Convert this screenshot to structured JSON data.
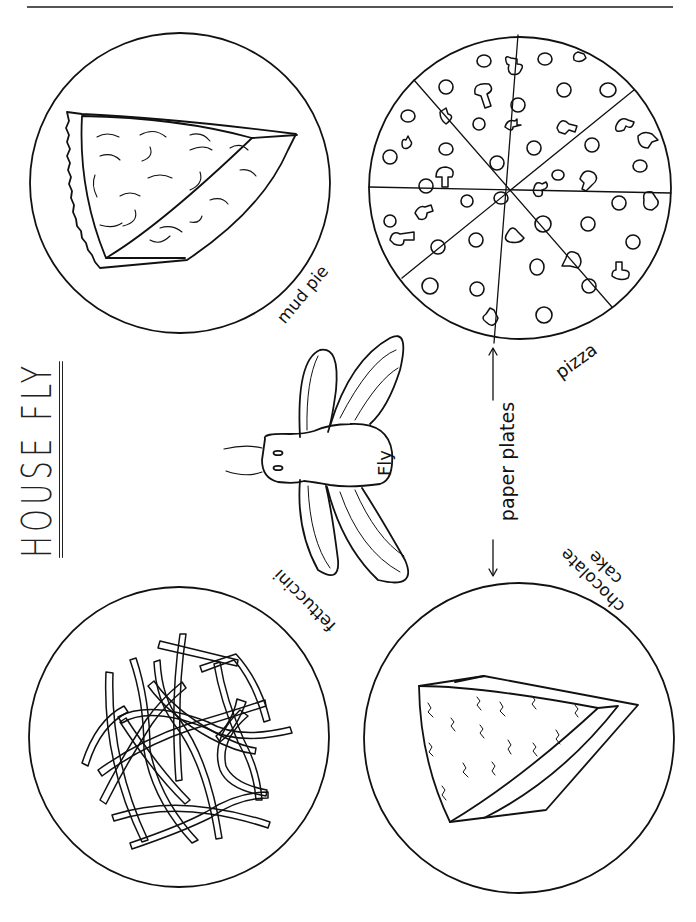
{
  "page": {
    "title": "HOUSE FLY",
    "background": "#ffffff",
    "ink_color": "#111111"
  },
  "plates": [
    {
      "id": "mud-pie",
      "label": "mud pie",
      "food": "pie slice with swirls",
      "cx": 180,
      "cy": 183,
      "r": 150
    },
    {
      "id": "pizza",
      "label": "pizza",
      "food": "pizza cut into 8 slices with pepperoni and mushrooms",
      "cx": 520,
      "cy": 188,
      "r": 151
    },
    {
      "id": "fettuccini",
      "label": "fettuccini",
      "food": "tangled pasta noodles",
      "cx": 179,
      "cy": 737,
      "r": 150
    },
    {
      "id": "chocolate-cake",
      "label_line1": "chocolate",
      "label_line2": "cake",
      "food": "cake slice with squiggles",
      "cx": 519,
      "cy": 738,
      "r": 155
    }
  ],
  "fly": {
    "label": "Fly"
  },
  "annotation": {
    "label": "paper plates"
  }
}
